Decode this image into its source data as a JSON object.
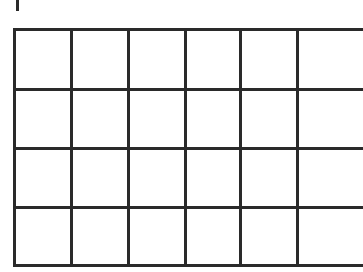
{
  "grid": {
    "rows": 4,
    "visible_columns": 6,
    "line_color": "#2a2a2a",
    "background": "#ffffff",
    "column_lines_x": [
      56,
      113,
      170,
      225,
      282
    ],
    "row_lines_y": [
      59,
      118,
      177
    ]
  },
  "top_mark": {
    "color": "#2a2a2a"
  }
}
